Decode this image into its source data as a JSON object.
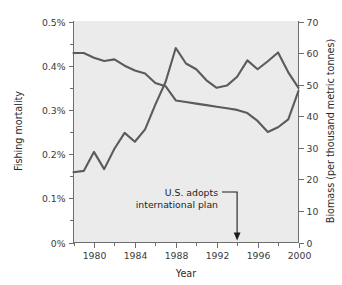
{
  "chart_data": {
    "type": "line",
    "title": "",
    "xlabel": "Year",
    "ylabel": "Fishing mortality",
    "y2label": "Biomass (per thousand metric tonnes)",
    "grid": false,
    "legend": "none",
    "xlim": [
      1978,
      2000
    ],
    "ylim": [
      0,
      0.5
    ],
    "y2lim": [
      0,
      70
    ],
    "x_ticks_major": [
      1980,
      1984,
      1988,
      1992,
      1996,
      2000
    ],
    "x_tick_labels": [
      "1980",
      "1984",
      "1988",
      "1992",
      "1996",
      "2000"
    ],
    "x_ticks_minor": [
      1978,
      1982,
      1986,
      1990,
      1994,
      1998
    ],
    "y_ticks_major": [
      0,
      0.1,
      0.2,
      0.3,
      0.4,
      0.5
    ],
    "y_tick_labels": [
      "0%",
      "0.1%",
      "0.2%",
      "0.3%",
      "0.4%",
      "0.5%"
    ],
    "y_ticks_minor": [
      0.05,
      0.15,
      0.25,
      0.35,
      0.45
    ],
    "y2_ticks_major": [
      0,
      10,
      20,
      30,
      40,
      50,
      60,
      70
    ],
    "y2_tick_labels": [
      "0",
      "10",
      "20",
      "30",
      "40",
      "50",
      "60",
      "70"
    ],
    "x": [
      1978,
      1979,
      1980,
      1981,
      1982,
      1983,
      1984,
      1985,
      1986,
      1987,
      1988,
      1989,
      1990,
      1991,
      1992,
      1993,
      1994,
      1995,
      1996,
      1997,
      1998,
      1999,
      2000
    ],
    "series": [
      {
        "name": "Fishing mortality",
        "axis": "left",
        "unit": "%",
        "color": "#5b5b5b",
        "values": [
          0.159,
          0.162,
          0.205,
          0.166,
          0.212,
          0.248,
          0.228,
          0.256,
          0.312,
          0.363,
          0.44,
          0.405,
          0.392,
          0.367,
          0.35,
          0.355,
          0.375,
          0.412,
          0.392,
          0.41,
          0.43,
          0.385,
          0.35
        ]
      },
      {
        "name": "Biomass",
        "axis": "right",
        "unit": "thousand metric tonnes",
        "color": "#5b5b5b",
        "values": [
          60.0,
          60.0,
          58.5,
          57.5,
          58.0,
          56.0,
          54.5,
          53.5,
          50.5,
          49.5,
          45.0,
          44.5,
          44.0,
          43.5,
          43.0,
          42.5,
          42.0,
          41.0,
          38.5,
          35.0,
          36.5,
          39.0,
          48.0
        ]
      }
    ],
    "annotations": [
      {
        "name": "policy-annotation",
        "line1": "U.S. adopts",
        "line2": "international plan",
        "target_x": 1994,
        "target_y_axis": "left",
        "target_y": 0.0
      }
    ]
  }
}
